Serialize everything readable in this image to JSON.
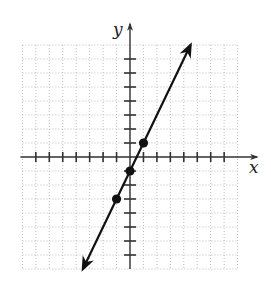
{
  "chart_data": {
    "type": "line",
    "title": "",
    "xlabel": "x",
    "ylabel": "y",
    "grid": true,
    "grid_range": {
      "x": [
        -8,
        8
      ],
      "y": [
        -8,
        8
      ]
    },
    "tick_range": {
      "x": [
        -7,
        7
      ],
      "y": [
        -7,
        7
      ]
    },
    "tick_labels": false,
    "line": {
      "slope": 2,
      "intercept": -1,
      "equation": "y = 2x - 1",
      "arrows": "both",
      "x_extent": [
        -3.5,
        4.5
      ]
    },
    "points": [
      {
        "x": 1,
        "y": 1
      },
      {
        "x": 0,
        "y": -1
      },
      {
        "x": -1,
        "y": -3
      }
    ],
    "colors": {
      "axis": "#333333",
      "line": "#111111",
      "grid": "#b5b5b5",
      "point": "#111111"
    }
  },
  "labels": {
    "x_axis": "x",
    "y_axis": "y"
  },
  "layout": {
    "origin": {
      "px": 130,
      "py": 157
    },
    "unit_x": 13.45,
    "unit_y": 14.0
  }
}
